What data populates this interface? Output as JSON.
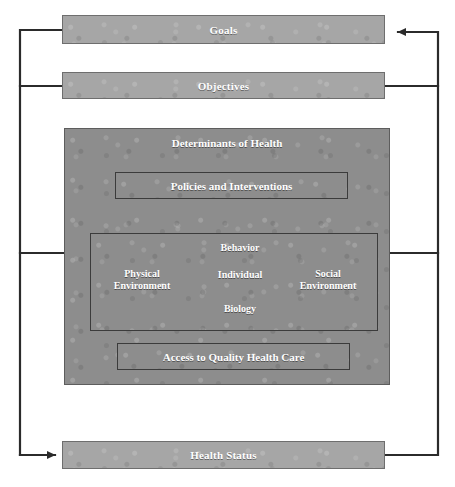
{
  "diagram": {
    "colors": {
      "bar_fill": "#a6a6a6",
      "panel_fill": "#8d8d8d",
      "line": "#2b2b2b",
      "text": "#ffffff",
      "background": "#ffffff"
    },
    "bars": {
      "goals": "Goals",
      "objectives": "Objectives",
      "health_status": "Health Status"
    },
    "panel": {
      "title": "Determinants of Health",
      "policies": "Policies and Interventions",
      "access": "Access to Quality Health Care"
    },
    "nodes": {
      "behavior": "Behavior",
      "individual": "Individual",
      "biology": "Biology",
      "physical_environment_line1": "Physical",
      "physical_environment_line2": "Environment",
      "social_environment_line1": "Social",
      "social_environment_line2": "Environment"
    }
  }
}
